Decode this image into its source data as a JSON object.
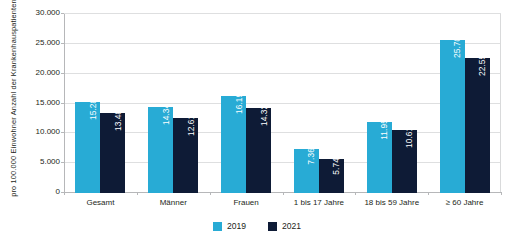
{
  "chart_data": {
    "type": "bar",
    "title": "",
    "subtitle": "",
    "xlabel": "",
    "ylabel_lines": [
      "Anzahl der Krankenhauspatienten",
      "pro 100.000 Einwohner"
    ],
    "categories": [
      "Gesamt",
      "Männer",
      "Frauen",
      "1 bis 17 Jahre",
      "18 bis 59 Jahre",
      "≥ 60 Jahre"
    ],
    "series": [
      {
        "name": "2019",
        "color": "#28abd5",
        "values": [
          15280,
          14340,
          16196,
          7364,
          11958,
          25709
        ],
        "labels": [
          "15.280",
          "14.340",
          "16.196",
          "7.364",
          "11.958",
          "25.709"
        ]
      },
      {
        "name": "2021",
        "color": "#0e1b36",
        "values": [
          13481,
          12613,
          14325,
          5748,
          10616,
          22555
        ],
        "labels": [
          "13.481",
          "12.613",
          "14.325",
          "5.748",
          "10.616",
          "22.555"
        ]
      }
    ],
    "ylim": [
      0,
      30000
    ],
    "yticks": [
      0,
      5000,
      10000,
      15000,
      20000,
      25000,
      30000
    ],
    "ytick_labels": [
      "0",
      "5.000",
      "10.000",
      "15.000",
      "20.000",
      "25.000",
      "30.000"
    ],
    "grid": true,
    "grid_axis": "y",
    "legend_position": "bottom-center",
    "legend": [
      "2019",
      "2021"
    ]
  }
}
